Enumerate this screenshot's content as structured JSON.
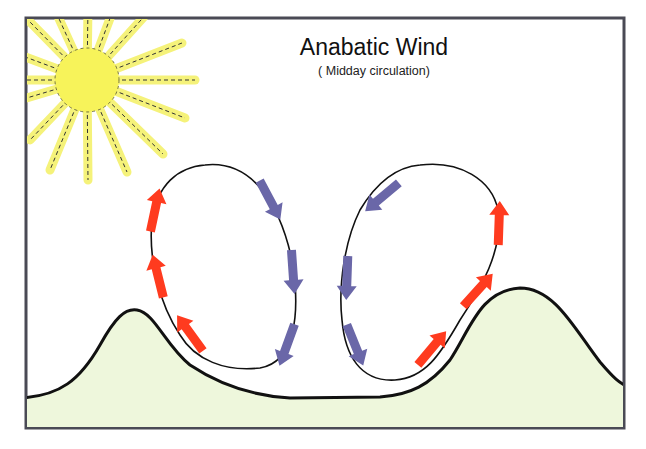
{
  "title": "Anabatic Wind",
  "subtitle": "( Midday circulation)",
  "colors": {
    "frame": "#4a4a55",
    "sun_fill": "#f7f35a",
    "sun_ray": "#f5f27a",
    "ray_dash": "#333333",
    "terrain_fill": "#eef7dc",
    "terrain_line": "#111111",
    "warm_arrow": "#ff3b1f",
    "cool_arrow": "#6a67a8",
    "loop_line": "#111111"
  },
  "elements": {
    "sun": "sun-icon",
    "left_cell": "left-circulation-cell",
    "right_cell": "right-circulation-cell",
    "terrain": "mountain-terrain",
    "warm_arrows": "upslope-warm-air-arrows",
    "cool_arrows": "sinking-cool-air-arrows"
  }
}
